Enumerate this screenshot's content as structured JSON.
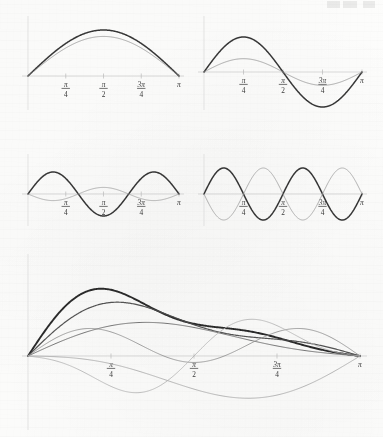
{
  "figure": {
    "kind": "multi-panel-plot",
    "background_color": "#fdfdfc",
    "header_mark": "faint-cropped-page-header"
  },
  "chart_data": [
    {
      "id": "panel-1",
      "type": "line",
      "title": "",
      "xlabel": "",
      "ylabel": "",
      "xlim": [
        0,
        3.14159
      ],
      "ylim": [
        -1.15,
        1.15
      ],
      "grid": false,
      "legend": "none",
      "tick_labels": [
        "π/4",
        "π/2",
        "3π/4",
        "π"
      ],
      "tick_numerators": [
        "π",
        "π",
        "3π",
        "π"
      ],
      "tick_denominators": [
        "4",
        "2",
        "4",
        ""
      ],
      "tick_values": [
        0.7854,
        1.5708,
        2.3562,
        3.14159
      ],
      "series": [
        {
          "name": "harmonic-1-bold",
          "k": 1,
          "amplitude": 1.0,
          "phase": 0,
          "color": "#2b2b2b",
          "width": 1.5
        },
        {
          "name": "harmonic-1-light",
          "k": 1,
          "amplitude": 0.86,
          "phase": 0,
          "color": "#8d8d8d",
          "width": 0.8
        }
      ]
    },
    {
      "id": "panel-2",
      "type": "line",
      "title": "",
      "xlabel": "",
      "ylabel": "",
      "xlim": [
        0,
        3.14159
      ],
      "ylim": [
        -1.15,
        1.15
      ],
      "grid": false,
      "legend": "none",
      "tick_labels": [
        "π/4",
        "π/2",
        "3π/4",
        "π"
      ],
      "tick_numerators": [
        "π",
        "π",
        "3π",
        "π"
      ],
      "tick_denominators": [
        "4",
        "2",
        "4",
        ""
      ],
      "tick_values": [
        0.7854,
        1.5708,
        2.3562,
        3.14159
      ],
      "series": [
        {
          "name": "harmonic-2-bold",
          "k": 2,
          "amplitude": 1.0,
          "phase": 0,
          "color": "#2b2b2b",
          "width": 1.5
        },
        {
          "name": "harmonic-2-light",
          "k": 2,
          "amplitude": 0.38,
          "phase": 0,
          "color": "#8d8d8d",
          "width": 0.8
        }
      ]
    },
    {
      "id": "panel-3",
      "type": "line",
      "title": "",
      "xlabel": "",
      "ylabel": "",
      "xlim": [
        0,
        3.14159
      ],
      "ylim": [
        -1.15,
        1.15
      ],
      "grid": false,
      "legend": "none",
      "tick_labels": [
        "π/4",
        "π/2",
        "3π/4",
        "π"
      ],
      "tick_numerators": [
        "π",
        "π",
        "3π",
        "π"
      ],
      "tick_denominators": [
        "4",
        "2",
        "4",
        ""
      ],
      "tick_values": [
        0.7854,
        1.5708,
        2.3562,
        3.14159
      ],
      "series": [
        {
          "name": "harmonic-3-bold",
          "k": 3,
          "amplitude": 1.0,
          "phase": 0,
          "color": "#2b2b2b",
          "width": 1.5
        },
        {
          "name": "harmonic-3-light",
          "k": 3,
          "amplitude": 0.3,
          "phase": 3.14159,
          "color": "#9a9a9a",
          "width": 0.8
        }
      ]
    },
    {
      "id": "panel-4",
      "type": "line",
      "title": "",
      "xlabel": "",
      "ylabel": "",
      "xlim": [
        0,
        3.14159
      ],
      "ylim": [
        -1.15,
        1.15
      ],
      "grid": false,
      "legend": "none",
      "tick_labels": [
        "π/4",
        "π/2",
        "3π/4",
        "π"
      ],
      "tick_numerators": [
        "π",
        "π",
        "3π",
        "π"
      ],
      "tick_denominators": [
        "4",
        "2",
        "4",
        ""
      ],
      "tick_values": [
        0.7854,
        1.5708,
        2.3562,
        3.14159
      ],
      "series": [
        {
          "name": "harmonic-4-bold",
          "k": 4,
          "amplitude": 1.0,
          "phase": 0,
          "color": "#2b2b2b",
          "width": 1.5
        },
        {
          "name": "harmonic-4-light",
          "k": 4,
          "amplitude": 1.0,
          "phase": 3.14159,
          "color": "#9a9a9a",
          "width": 0.8
        }
      ]
    },
    {
      "id": "panel-5",
      "type": "line",
      "title": "",
      "xlabel": "",
      "ylabel": "",
      "xlim": [
        0,
        3.14159
      ],
      "ylim": [
        -1.3,
        1.3
      ],
      "grid": false,
      "legend": "none",
      "tick_labels": [
        "π/4",
        "π/2",
        "3π/4",
        "π"
      ],
      "tick_numerators": [
        "π",
        "π",
        "3π",
        "π"
      ],
      "tick_denominators": [
        "4",
        "2",
        "4",
        ""
      ],
      "tick_values": [
        0.7854,
        1.5708,
        2.3562,
        3.14159
      ],
      "series": [
        {
          "name": "partial-sum-bold",
          "terms": [
            [
              1,
              1.0,
              0
            ],
            [
              2,
              0.52,
              0
            ],
            [
              3,
              0.3,
              0
            ],
            [
              4,
              0.14,
              0
            ]
          ],
          "color": "#1f1f1f",
          "width": 1.9
        },
        {
          "name": "partial-sum-dark",
          "terms": [
            [
              1,
              0.88,
              0
            ],
            [
              2,
              0.4,
              0
            ],
            [
              3,
              0.2,
              0
            ]
          ],
          "color": "#4a4a4a",
          "width": 1.2
        },
        {
          "name": "partial-sum-mid",
          "terms": [
            [
              1,
              0.62,
              0
            ],
            [
              2,
              0.22,
              0
            ]
          ],
          "color": "#6e6e6e",
          "width": 1.0
        },
        {
          "name": "partial-sum-light",
          "terms": [
            [
              1,
              0.3,
              0
            ],
            [
              3,
              0.44,
              0
            ]
          ],
          "color": "#8f8f8f",
          "width": 0.9
        },
        {
          "name": "partial-sum-faint",
          "terms": [
            [
              1,
              -0.72,
              0
            ],
            [
              2,
              0.34,
              0
            ]
          ],
          "color": "#a9a9a9",
          "width": 0.9
        },
        {
          "name": "partial-sum-faintest",
          "terms": [
            [
              2,
              -0.66,
              0
            ],
            [
              4,
              0.26,
              0
            ]
          ],
          "color": "#b4b4b4",
          "width": 0.9
        }
      ]
    }
  ]
}
